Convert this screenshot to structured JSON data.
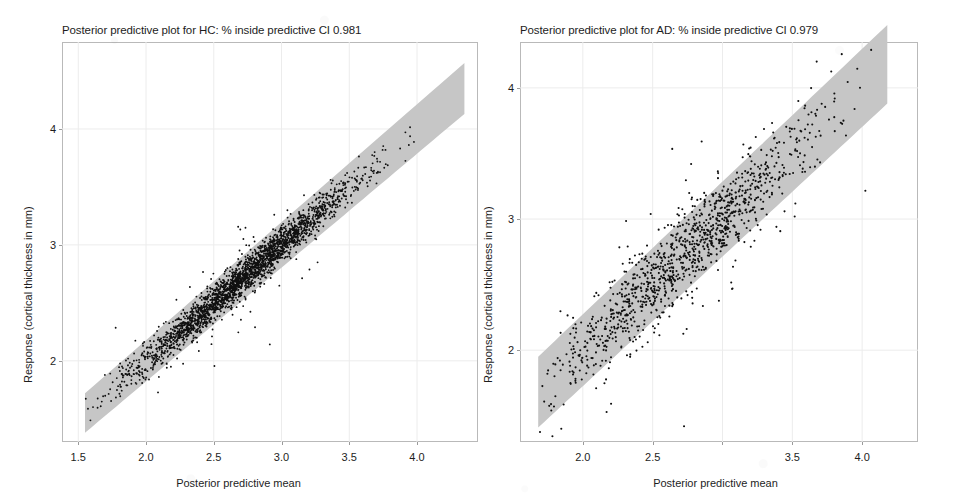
{
  "figure": {
    "background_color": "#ffffff",
    "point_color": "#101010",
    "band_color": "#c6c6c6",
    "frame_color": "#b9b9b9"
  },
  "panels": [
    {
      "id": "hc",
      "title": "Posterior predictive plot for HC: % inside predictive CI 0.981",
      "xlabel": "Posterior predictive mean",
      "ylabel": "Response (cortical thickness in mm)",
      "xticks": [
        "1.5",
        "2.0",
        "2.5",
        "3.0",
        "3.5",
        "4.0"
      ],
      "xtick_values": [
        1.5,
        2.0,
        2.5,
        3.0,
        3.5,
        4.0
      ],
      "yticks": [
        "2",
        "3",
        "4"
      ],
      "ytick_values": [
        2,
        3,
        4
      ]
    },
    {
      "id": "ad",
      "title": "Posterior predictive plot for AD: % inside predictive CI 0.979",
      "xlabel": "Posterior predictive mean",
      "ylabel": "Response (cortical thickness in mm)",
      "xticks": [
        "2.0",
        "2.5",
        "",
        "3.5",
        "4.0"
      ],
      "xtick_values": [
        2.0,
        2.5,
        3.0,
        3.5,
        4.0
      ],
      "yticks": [
        "2",
        "3",
        "4"
      ],
      "ytick_values": [
        2,
        3,
        4
      ]
    }
  ],
  "chart_data": [
    {
      "type": "scatter",
      "panel": "hc",
      "title": "Posterior predictive plot for HC: % inside predictive CI 0.981",
      "xlabel": "Posterior predictive mean",
      "ylabel": "Response (cortical thickness in mm)",
      "percent_inside_predictive_ci": 0.981,
      "group": "HC",
      "xlim": [
        1.38,
        4.45
      ],
      "ylim": [
        1.3,
        4.75
      ],
      "grid": true,
      "legend": "none",
      "n_points": 2600,
      "point_color": "#101010",
      "point_size_px": 1.9,
      "identity_line": {
        "slope": 1.0,
        "intercept": 0.0
      },
      "credible_band": {
        "description": "shaded 95% posterior predictive interval band around the identity line",
        "color": "#c6c6c6",
        "half_width_at_x_low": 0.17,
        "half_width_at_x_high": 0.22,
        "x_start": 1.55,
        "x_end": 4.35
      },
      "scatter_model": {
        "x_distribution": "normal",
        "x_mean": 2.72,
        "x_sd": 0.4,
        "x_min": 1.55,
        "x_max": 4.35,
        "residual_sd": 0.075,
        "outlier_fraction": 0.035,
        "outlier_sd_multiplier": 3.2
      }
    },
    {
      "type": "scatter",
      "panel": "ad",
      "title": "Posterior predictive plot for AD: % inside predictive CI 0.979",
      "xlabel": "Posterior predictive mean",
      "ylabel": "Response (cortical thickness in mm)",
      "percent_inside_predictive_ci": 0.979,
      "group": "AD",
      "xlim": [
        1.55,
        4.4
      ],
      "ylim": [
        1.3,
        4.35
      ],
      "grid": true,
      "legend": "none",
      "n_points": 1150,
      "point_color": "#101010",
      "point_size_px": 2.1,
      "identity_line": {
        "slope": 1.0,
        "intercept": 0.0
      },
      "credible_band": {
        "description": "shaded 95% posterior predictive interval band around the identity line",
        "color": "#c6c6c6",
        "half_width_at_x_low": 0.27,
        "half_width_at_x_high": 0.3,
        "x_start": 1.68,
        "x_end": 4.18
      },
      "scatter_model": {
        "x_distribution": "normal",
        "x_mean": 2.7,
        "x_sd": 0.48,
        "x_min": 1.68,
        "x_max": 4.18,
        "residual_sd": 0.155,
        "outlier_fraction": 0.06,
        "outlier_sd_multiplier": 2.6
      }
    }
  ]
}
